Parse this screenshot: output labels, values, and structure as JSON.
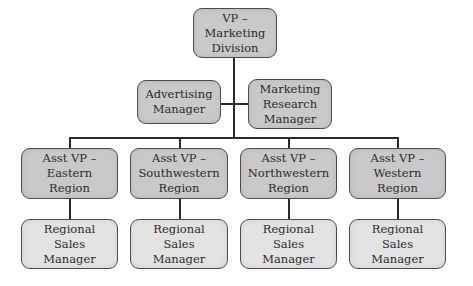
{
  "colors": {
    "box_dark": "#c9c9c9",
    "box_light": "#e3e3e3",
    "border": "#4a4a4a",
    "line": "#2a2a2a",
    "background": "#ffffff"
  },
  "org": {
    "root": {
      "lines": [
        "VP –",
        "Marketing",
        "Division"
      ]
    },
    "staff": [
      {
        "lines": [
          "Advertising",
          "Manager"
        ]
      },
      {
        "lines": [
          "Marketing",
          "Research",
          "Manager"
        ]
      }
    ],
    "regions": [
      {
        "lines": [
          "Asst VP –",
          "Eastern",
          "Region"
        ],
        "report": {
          "lines": [
            "Regional",
            "Sales",
            "Manager"
          ]
        }
      },
      {
        "lines": [
          "Asst VP –",
          "Southwestern",
          "Region"
        ],
        "report": {
          "lines": [
            "Regional",
            "Sales",
            "Manager"
          ]
        }
      },
      {
        "lines": [
          "Asst VP –",
          "Northwestern",
          "Region"
        ],
        "report": {
          "lines": [
            "Regional",
            "Sales",
            "Manager"
          ]
        }
      },
      {
        "lines": [
          "Asst VP –",
          "Western",
          "Region"
        ],
        "report": {
          "lines": [
            "Regional",
            "Sales",
            "Manager"
          ]
        }
      }
    ]
  }
}
